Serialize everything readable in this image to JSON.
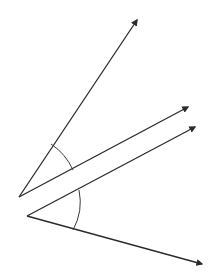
{
  "diagram": {
    "title": "Two angles formed by pairs of rays",
    "stroke_color": "#2b2b2b",
    "background": "#ffffff",
    "angles": [
      {
        "name": "upper-angle",
        "vertex": [
          19,
          197
        ],
        "rays": [
          {
            "name": "upper-ray-steep",
            "end": [
              137,
              20
            ]
          },
          {
            "name": "upper-ray-shallow",
            "end": [
              188,
              107
            ]
          }
        ],
        "arc": {
          "start": [
            51,
            144
          ],
          "end": [
            73,
            170
          ],
          "radius": 62
        }
      },
      {
        "name": "lower-angle",
        "vertex": [
          27,
          216
        ],
        "rays": [
          {
            "name": "lower-ray-upward",
            "end": [
              195,
              127
            ]
          },
          {
            "name": "lower-ray-downward",
            "end": [
              202,
              264
            ]
          }
        ],
        "arc": {
          "start": [
            79,
            190
          ],
          "end": [
            73,
            230
          ],
          "radius": 58
        }
      }
    ]
  }
}
